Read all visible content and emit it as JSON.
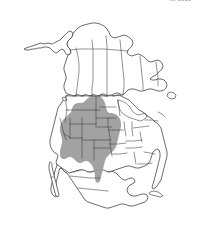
{
  "figure": {
    "kind": "species-range-map",
    "region": "North America",
    "attribution": "(c) 2013",
    "background_color": "#ffffff",
    "outline_color": "#2e2e2e",
    "subdivision_color": "#3a3a3a",
    "range_fill_color": "#9a9a9a",
    "width_px": 197,
    "height_px": 225
  },
  "legend": {
    "range_label": "Distribution range",
    "range_color": "#9a9a9a"
  },
  "map": {
    "title": "North America distribution",
    "projection_hint": "equal-area conic",
    "landmasses": [
      "Alaska",
      "Canada",
      "Greenland edge",
      "Contiguous United States",
      "Mexico",
      "Baja California",
      "Yucatan Peninsula",
      "Newfoundland",
      "Cuba"
    ],
    "shaded_areas": [
      "Alberta",
      "Saskatchewan",
      "Montana",
      "North Dakota",
      "South Dakota",
      "Wyoming",
      "Nebraska",
      "Colorado",
      "Kansas",
      "New Mexico",
      "Oklahoma",
      "Texas Panhandle",
      "Northern Mexico - Chihuahua",
      "Northern Mexico - Coahuila"
    ],
    "unshaded_regions": [
      "Pacific Northwest",
      "California",
      "Great Lakes",
      "Eastern Seaboard",
      "Florida",
      "Gulf Coast",
      "Southern Mexico"
    ]
  }
}
